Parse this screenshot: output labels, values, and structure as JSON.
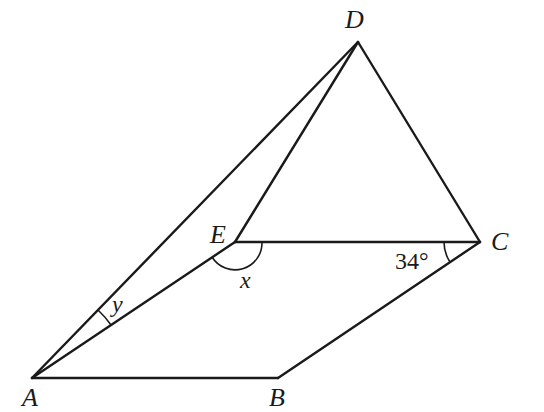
{
  "diagram": {
    "type": "geometry",
    "points": {
      "A": {
        "label": "A",
        "x": 32,
        "y": 378
      },
      "B": {
        "label": "B",
        "x": 278,
        "y": 378
      },
      "C": {
        "label": "C",
        "x": 480,
        "y": 242
      },
      "D": {
        "label": "D",
        "x": 358,
        "y": 42
      },
      "E": {
        "label": "E",
        "x": 235,
        "y": 242
      }
    },
    "segments": [
      "AB",
      "BC",
      "CE",
      "EA",
      "AD",
      "ED",
      "DC"
    ],
    "angles": {
      "x": {
        "label": "x",
        "vertex": "E",
        "description": "reflex-side angle AEC below line EC"
      },
      "y": {
        "label": "y",
        "vertex": "A",
        "description": "angle DAE"
      },
      "c": {
        "label": "34°",
        "vertex": "C",
        "description": "angle ECB"
      }
    }
  }
}
